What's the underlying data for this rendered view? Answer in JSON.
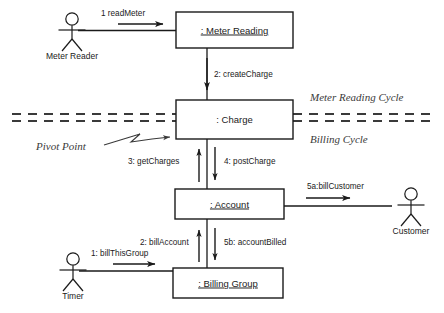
{
  "diagram": {
    "objects": [
      {
        "id": "meter_reading",
        "label": ": Meter Reading",
        "underlined": true
      },
      {
        "id": "charge",
        "label": ": Charge",
        "underlined": false
      },
      {
        "id": "account",
        "label": ": Account",
        "underlined": true
      },
      {
        "id": "billing_group",
        "label": ": Billing Group",
        "underlined": true
      }
    ],
    "actors": [
      {
        "id": "meter_reader",
        "label": "Meter Reader"
      },
      {
        "id": "customer",
        "label": "Customer"
      },
      {
        "id": "timer",
        "label": "Timer"
      }
    ],
    "messages": [
      {
        "id": "m1",
        "label": "1 readMeter",
        "from": "meter_reader",
        "to": "meter_reading"
      },
      {
        "id": "m2",
        "label": "2: createCharge",
        "from": "meter_reading",
        "to": "charge"
      },
      {
        "id": "m3",
        "label": "3: getCharges",
        "from": "account",
        "to": "charge"
      },
      {
        "id": "m4",
        "label": "4: postCharge",
        "from": "charge",
        "to": "account"
      },
      {
        "id": "m5a",
        "label": "5a:billCustomer",
        "from": "account",
        "to": "customer"
      },
      {
        "id": "m5b",
        "label": "5b: accountBilled",
        "from": "account",
        "to": "billing_group"
      },
      {
        "id": "m2b",
        "label": "2: billAccount",
        "from": "billing_group",
        "to": "account"
      },
      {
        "id": "m1b",
        "label": "1: billThisGroup",
        "from": "timer",
        "to": "billing_group"
      }
    ],
    "annotations": [
      {
        "id": "pivot_point",
        "label": "Pivot Point"
      },
      {
        "id": "meter_reading_cycle",
        "label": "Meter Reading Cycle"
      },
      {
        "id": "billing_cycle",
        "label": "Billing Cycle"
      }
    ],
    "colors": {
      "stroke": "#1a1a1a",
      "annotation": "#3a3a3a",
      "background": "#ffffff"
    }
  }
}
